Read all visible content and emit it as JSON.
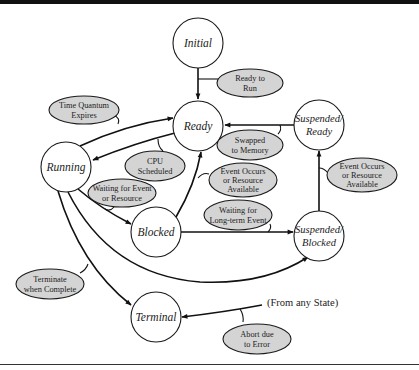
{
  "diagram": {
    "type": "process-state-transition",
    "colors": {
      "state_fill": "#ffffff",
      "condition_fill": "#d4d4d4",
      "stroke": "#111111",
      "top_bar": "#111111"
    },
    "states": {
      "initial": {
        "label": "Initial"
      },
      "ready": {
        "label": "Ready"
      },
      "running": {
        "label": "Running"
      },
      "blocked": {
        "label": "Blocked"
      },
      "terminal": {
        "label": "Terminal"
      },
      "suspended_ready": {
        "line1": "Suspended/",
        "line2": "Ready"
      },
      "suspended_blocked": {
        "line1": "Suspended/",
        "line2": "Blocked"
      }
    },
    "conditions": {
      "ready_to_run": {
        "line1": "Ready to",
        "line2": "Run"
      },
      "time_quantum_expires": {
        "line1": "Time Quantum",
        "line2": "Expires"
      },
      "cpu_scheduled": {
        "line1": "CPU",
        "line2": "Scheduled"
      },
      "swapped_to_memory": {
        "line1": "Swapped",
        "line2": "to Memory"
      },
      "waiting_for_event": {
        "line1": "Waiting for Event",
        "line2": "or Resource"
      },
      "event_occurs_middle": {
        "line1": "Event Occurs",
        "line2": "or Resource",
        "line3": "Available"
      },
      "event_occurs_right": {
        "line1": "Event Occurs",
        "line2": "or Resource",
        "line3": "Available"
      },
      "waiting_long_term": {
        "line1": "Waiting for",
        "line2": "Long-term Event"
      },
      "terminate_when_complete": {
        "line1": "Terminate",
        "line2": "when Complete"
      },
      "abort_due_to_error": {
        "line1": "Abort due",
        "line2": "to Error"
      }
    },
    "free_labels": {
      "from_any_state": "(From any State)"
    },
    "transitions": [
      {
        "from": "Initial",
        "to": "Ready",
        "condition": "Ready to Run"
      },
      {
        "from": "Running",
        "to": "Ready",
        "condition": "Time Quantum Expires"
      },
      {
        "from": "Ready",
        "to": "Running",
        "condition": "CPU Scheduled"
      },
      {
        "from": "Suspended/Ready",
        "to": "Ready",
        "condition": "Swapped to Memory"
      },
      {
        "from": "Running",
        "to": "Blocked",
        "condition": "Waiting for Event or Resource"
      },
      {
        "from": "Blocked",
        "to": "Ready",
        "condition": "Event Occurs or Resource Available"
      },
      {
        "from": "Blocked",
        "to": "Suspended/Blocked",
        "condition": "Waiting for Long-term Event"
      },
      {
        "from": "Suspended/Blocked",
        "to": "Suspended/Ready",
        "condition": "Event Occurs or Resource Available"
      },
      {
        "from": "Running",
        "to": "Suspended/Blocked",
        "condition": ""
      },
      {
        "from": "Running",
        "to": "Terminal",
        "condition": "Terminate when Complete"
      },
      {
        "from": "(From any State)",
        "to": "Terminal",
        "condition": "Abort due to Error"
      }
    ]
  }
}
